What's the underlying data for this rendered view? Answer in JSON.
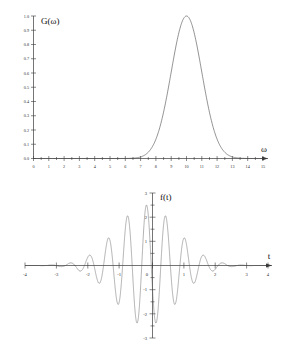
{
  "figure": {
    "background": "#ffffff",
    "curve_color": "#4a4a4a",
    "axis_color": "#3a3a3a"
  },
  "chart_data": [
    {
      "type": "line",
      "id": "spectrum",
      "title": "",
      "ylabel": "G(ω)",
      "xlabel": "ω",
      "xlim": [
        0,
        15
      ],
      "ylim": [
        0.0,
        1.0
      ],
      "grid": false,
      "legend": "none",
      "xticks": [
        0,
        1,
        2,
        3,
        4,
        5,
        6,
        7,
        8,
        9,
        10,
        11,
        12,
        13,
        14,
        15
      ],
      "xticklabels": [
        "0",
        "1",
        "2",
        "3",
        "4",
        "5",
        "6",
        "7",
        "8",
        "9",
        "10",
        "11",
        "12",
        "13",
        "14",
        "15"
      ],
      "yticks": [
        0.0,
        0.1,
        0.2,
        0.3,
        0.4,
        0.5,
        0.6,
        0.7,
        0.8,
        0.9,
        1.0
      ],
      "yticklabels": [
        "0.0",
        "0.1",
        "0.2",
        "0.3",
        "0.4",
        "0.5",
        "0.6",
        "0.7",
        "0.8",
        "0.9",
        "1.0"
      ],
      "description": "Gaussian spectrum peaked at omega = 10 with amplitude 1.0",
      "gaussian": {
        "center": 10.0,
        "sigma": 1.0,
        "amplitude": 1.0
      },
      "x": [
        0,
        1,
        2,
        3,
        4,
        5,
        6,
        6.5,
        7,
        7.5,
        8,
        8.5,
        9,
        9.5,
        10,
        10.5,
        11,
        11.5,
        12,
        12.5,
        13,
        13.5,
        14,
        15
      ],
      "y": [
        0.0,
        0.0,
        0.0,
        0.0,
        0.0,
        0.0,
        0.0,
        0.0,
        0.01,
        0.04,
        0.14,
        0.32,
        0.61,
        0.88,
        1.0,
        0.88,
        0.61,
        0.32,
        0.14,
        0.04,
        0.01,
        0.0,
        0.0,
        0.0
      ]
    },
    {
      "type": "line",
      "id": "wavepacket",
      "title": "",
      "ylabel": "f(t)",
      "xlabel": "t",
      "xlim": [
        -4,
        4
      ],
      "ylim": [
        -3,
        3
      ],
      "grid": false,
      "legend": "none",
      "xticks": [
        -4,
        -3,
        -2,
        -1,
        0,
        1,
        2,
        3,
        4
      ],
      "xticklabels": [
        "-4",
        "-3",
        "-2",
        "-1",
        "0",
        "1",
        "2",
        "3",
        "4"
      ],
      "yticks": [
        -3,
        -2,
        -1,
        0,
        1,
        2,
        3
      ],
      "yticklabels": [
        "-3",
        "-2",
        "-1",
        "0",
        "1",
        "2",
        "3"
      ],
      "description": "Gaussian-modulated carrier wave packet, carrier frequency 10 rad/unit, envelope sigma 1.0, peak amplitude 2.5",
      "packet": {
        "carrier_omega": 10.0,
        "envelope_sigma": 1.0,
        "peak_amplitude": 2.5,
        "center": 0.0
      }
    }
  ]
}
